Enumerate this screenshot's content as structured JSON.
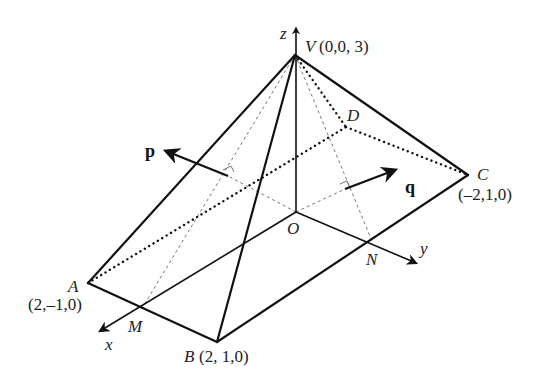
{
  "figure": {
    "points": {
      "V": {
        "name": "V",
        "coords": "(0,0, 3)"
      },
      "A": {
        "name": "A",
        "coords": "(2,–1,0)"
      },
      "B": {
        "name": "B",
        "coords": "(2, 1,0)"
      },
      "C": {
        "name": "C",
        "coords": "(–2,1,0)"
      },
      "D": {
        "name": "D"
      },
      "O": {
        "name": "O"
      },
      "M": {
        "name": "M"
      },
      "N": {
        "name": "N"
      }
    },
    "axes": {
      "x": "x",
      "y": "y",
      "z": "z"
    },
    "vectors": {
      "p": "p",
      "q": "q"
    }
  }
}
